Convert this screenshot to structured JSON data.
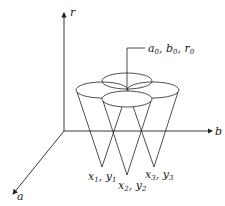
{
  "diagram": {
    "title": "",
    "axes": {
      "r": {
        "label": "r"
      },
      "b": {
        "label": "b"
      },
      "a": {
        "label": "a"
      }
    },
    "center_point": {
      "a": "a",
      "a_sub": "0",
      "b": "b",
      "b_sub": "0",
      "r": "r",
      "r_sub": "0"
    },
    "points": [
      {
        "x": "x",
        "x_sub": "1",
        "y": "y",
        "y_sub": "1"
      },
      {
        "x": "x",
        "x_sub": "2",
        "y": "y",
        "y_sub": "2"
      },
      {
        "x": "x",
        "x_sub": "3",
        "y": "y",
        "y_sub": "3"
      }
    ],
    "colors": {
      "line": "#222222",
      "background": "#ffffff"
    }
  }
}
